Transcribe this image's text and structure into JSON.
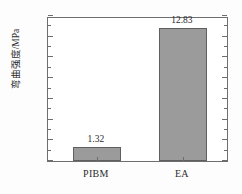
{
  "chart_data": {
    "type": "bar",
    "title": "",
    "subtitle": "",
    "xlabel": "",
    "ylabel": "弯曲强度/MPa",
    "categories": [
      "PIBM",
      "EA"
    ],
    "values": [
      1.32,
      12.83
    ],
    "data_labels": [
      "1.32",
      "12.83"
    ],
    "ylim": [
      0,
      14
    ],
    "y_major_step": 2,
    "y_minor_step": 1,
    "y_ticks": [
      0,
      2,
      4,
      6,
      8,
      10,
      12,
      14
    ],
    "y_tick_labels": [
      "0",
      "2",
      "4",
      "6",
      "8",
      "10",
      "12",
      "14"
    ],
    "grid": false,
    "legend": null,
    "series": [
      {
        "name": "弯曲强度",
        "values": [
          1.32,
          12.83
        ]
      }
    ],
    "colors": {
      "bar_fill": "#9b9b9b",
      "bar_edge": "#5f5f5f",
      "axis": "#6e6e6e",
      "text": "#2b2b2b",
      "background": "#ffffff"
    }
  }
}
